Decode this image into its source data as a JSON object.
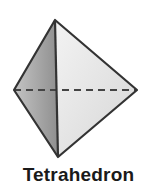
{
  "figure": {
    "label": "Tetrahedron",
    "vertices": {
      "top": [
        55,
        20
      ],
      "left": [
        14,
        90
      ],
      "right": [
        137,
        90
      ],
      "bottom": [
        58,
        157
      ]
    },
    "colors": {
      "left_face": "#a8a8a8",
      "right_face": "#e6e6e6",
      "edge": "#333333",
      "hidden_edge": "#444444"
    }
  }
}
